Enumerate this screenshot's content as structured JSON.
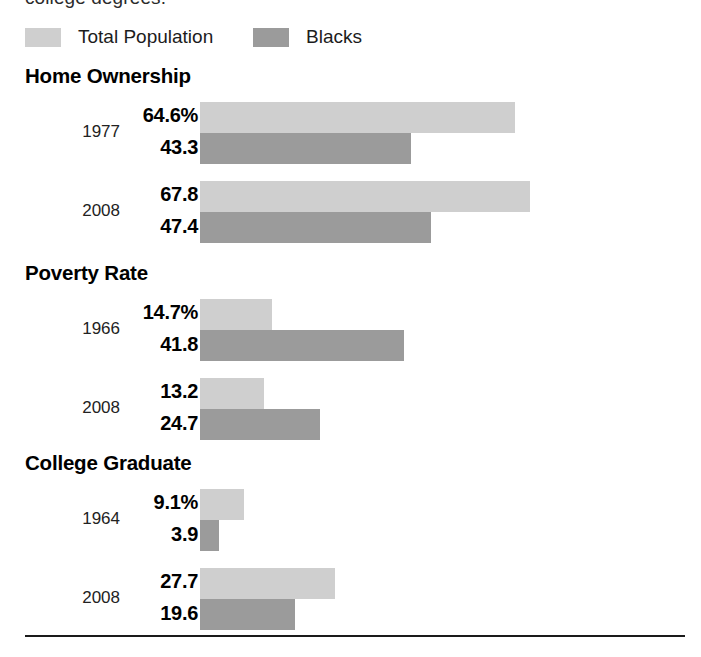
{
  "caption_clipped": "college degrees.",
  "legend": {
    "items": [
      {
        "label": "Total Population",
        "color": "#cfcfcf",
        "key": "total"
      },
      {
        "label": "Blacks",
        "color": "#9b9b9b",
        "key": "blacks"
      }
    ]
  },
  "sections": [
    {
      "title": "Home Ownership",
      "rows": [
        {
          "year": "1977",
          "total_label": "64.6%",
          "blacks_label": "43.3",
          "total": 64.6,
          "blacks": 43.3
        },
        {
          "year": "2008",
          "total_label": "67.8",
          "blacks_label": "47.4",
          "total": 67.8,
          "blacks": 47.4
        }
      ]
    },
    {
      "title": "Poverty Rate",
      "rows": [
        {
          "year": "1966",
          "total_label": "14.7%",
          "blacks_label": "41.8",
          "total": 14.7,
          "blacks": 41.8
        },
        {
          "year": "2008",
          "total_label": "13.2",
          "blacks_label": "24.7",
          "total": 13.2,
          "blacks": 24.7
        }
      ]
    },
    {
      "title": "College Graduate",
      "rows": [
        {
          "year": "1964",
          "total_label": "9.1%",
          "blacks_label": "3.9",
          "total": 9.1,
          "blacks": 3.9
        },
        {
          "year": "2008",
          "total_label": "27.7",
          "blacks_label": "19.6",
          "total": 27.7,
          "blacks": 19.6
        }
      ]
    }
  ],
  "chart_data": {
    "type": "bar",
    "orientation": "horizontal",
    "title": "",
    "xlabel": "",
    "ylabel": "",
    "units": "percent",
    "px_per_unit": 4.87,
    "bar_origin_px": 200,
    "grid": false,
    "legend_position": "top-left",
    "legend_entries": [
      "Total Population",
      "Blacks"
    ],
    "groups": [
      {
        "name": "Home Ownership",
        "categories": [
          "1977",
          "2008"
        ],
        "series": [
          {
            "name": "Total Population",
            "values": [
              64.6,
              67.8
            ],
            "color": "#cfcfcf"
          },
          {
            "name": "Blacks",
            "values": [
              43.3,
              47.4
            ],
            "color": "#9b9b9b"
          }
        ]
      },
      {
        "name": "Poverty Rate",
        "categories": [
          "1966",
          "2008"
        ],
        "series": [
          {
            "name": "Total Population",
            "values": [
              14.7,
              13.2
            ],
            "color": "#cfcfcf"
          },
          {
            "name": "Blacks",
            "values": [
              41.8,
              24.7
            ],
            "color": "#9b9b9b"
          }
        ]
      },
      {
        "name": "College Graduate",
        "categories": [
          "1964",
          "2008"
        ],
        "series": [
          {
            "name": "Total Population",
            "values": [
              9.1,
              27.7
            ],
            "color": "#cfcfcf"
          },
          {
            "name": "Blacks",
            "values": [
              3.9,
              19.6
            ],
            "color": "#9b9b9b"
          }
        ]
      }
    ],
    "annotations": [
      "64.6%",
      "43.3",
      "67.8",
      "47.4",
      "14.7%",
      "41.8",
      "13.2",
      "24.7",
      "9.1%",
      "3.9",
      "27.7",
      "19.6"
    ]
  }
}
